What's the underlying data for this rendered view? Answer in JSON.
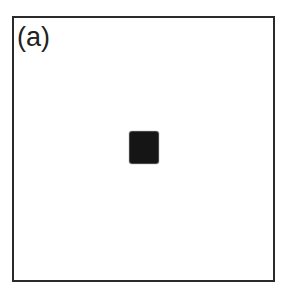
{
  "panel": {
    "label": "(a)",
    "frame_color": "#2a2a2a",
    "square_color": "#151515"
  }
}
